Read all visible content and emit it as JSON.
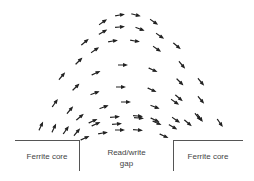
{
  "labels": {
    "left_core": "Ferrite core",
    "gap_line1": "Read/write",
    "gap_line2": "gap",
    "right_core": "Ferrite core"
  },
  "colors": {
    "arrow": "#222222",
    "line": "#555555",
    "text": "#444444"
  },
  "arrows": [
    {
      "x": 103,
      "y": 22,
      "a": -35
    },
    {
      "x": 120,
      "y": 15,
      "a": -10
    },
    {
      "x": 136,
      "y": 15,
      "a": 15
    },
    {
      "x": 154,
      "y": 22,
      "a": 35
    },
    {
      "x": 103,
      "y": 32,
      "a": -30
    },
    {
      "x": 120,
      "y": 27,
      "a": -5
    },
    {
      "x": 140,
      "y": 29,
      "a": 20
    },
    {
      "x": 160,
      "y": 36,
      "a": 35
    },
    {
      "x": 85,
      "y": 42,
      "a": -40
    },
    {
      "x": 113,
      "y": 41,
      "a": -10
    },
    {
      "x": 135,
      "y": 41,
      "a": 10
    },
    {
      "x": 157,
      "y": 49,
      "a": 35
    },
    {
      "x": 177,
      "y": 46,
      "a": 40
    },
    {
      "x": 95,
      "y": 50,
      "a": -35
    },
    {
      "x": 79,
      "y": 61,
      "a": -45
    },
    {
      "x": 123,
      "y": 65,
      "a": 0
    },
    {
      "x": 153,
      "y": 70,
      "a": 25
    },
    {
      "x": 182,
      "y": 65,
      "a": 50
    },
    {
      "x": 62,
      "y": 76,
      "a": -50
    },
    {
      "x": 96,
      "y": 73,
      "a": -25
    },
    {
      "x": 180,
      "y": 82,
      "a": 45
    },
    {
      "x": 201,
      "y": 82,
      "a": 50
    },
    {
      "x": 76,
      "y": 87,
      "a": -45
    },
    {
      "x": 95,
      "y": 93,
      "a": -20
    },
    {
      "x": 121,
      "y": 87,
      "a": 0
    },
    {
      "x": 152,
      "y": 90,
      "a": 25
    },
    {
      "x": 179,
      "y": 98,
      "a": 40
    },
    {
      "x": 201,
      "y": 100,
      "a": 50
    },
    {
      "x": 55,
      "y": 103,
      "a": -55
    },
    {
      "x": 70,
      "y": 110,
      "a": -50
    },
    {
      "x": 104,
      "y": 107,
      "a": -20
    },
    {
      "x": 126,
      "y": 102,
      "a": 0
    },
    {
      "x": 155,
      "y": 107,
      "a": 20
    },
    {
      "x": 175,
      "y": 102,
      "a": 35
    },
    {
      "x": 80,
      "y": 117,
      "a": -40
    },
    {
      "x": 93,
      "y": 121,
      "a": -25
    },
    {
      "x": 115,
      "y": 117,
      "a": -5
    },
    {
      "x": 138,
      "y": 116,
      "a": 5
    },
    {
      "x": 155,
      "y": 120,
      "a": 25
    },
    {
      "x": 176,
      "y": 120,
      "a": 35
    },
    {
      "x": 198,
      "y": 117,
      "a": 50
    },
    {
      "x": 41,
      "y": 126,
      "a": -65
    },
    {
      "x": 54,
      "y": 128,
      "a": -65
    },
    {
      "x": 66,
      "y": 130,
      "a": -55
    },
    {
      "x": 77,
      "y": 132,
      "a": -50
    },
    {
      "x": 96,
      "y": 124,
      "a": -25
    },
    {
      "x": 117,
      "y": 124,
      "a": -5
    },
    {
      "x": 139,
      "y": 118,
      "a": 5
    },
    {
      "x": 157,
      "y": 123,
      "a": 25
    },
    {
      "x": 173,
      "y": 127,
      "a": 30
    },
    {
      "x": 188,
      "y": 123,
      "a": 40
    },
    {
      "x": 200,
      "y": 118,
      "a": 55
    },
    {
      "x": 220,
      "y": 123,
      "a": 55
    },
    {
      "x": 85,
      "y": 138,
      "a": -25
    },
    {
      "x": 103,
      "y": 133,
      "a": -10
    },
    {
      "x": 120,
      "y": 130,
      "a": 0
    },
    {
      "x": 138,
      "y": 130,
      "a": 5
    },
    {
      "x": 164,
      "y": 136,
      "a": 25
    }
  ]
}
